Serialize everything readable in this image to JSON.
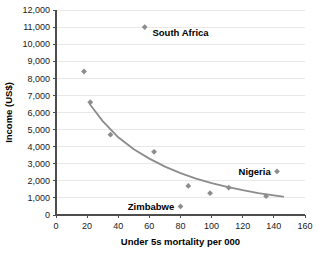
{
  "chart_data": {
    "type": "scatter",
    "title": "",
    "xlabel": "Under 5s mortality per 000",
    "ylabel": "Income (US$)",
    "xlim": [
      0,
      160
    ],
    "ylim": [
      0,
      12000
    ],
    "grid": "horizontal",
    "legend": "none",
    "xticks": [
      "0",
      "20",
      "40",
      "60",
      "80",
      "100",
      "120",
      "140",
      "160"
    ],
    "xtick_values": [
      0,
      20,
      40,
      60,
      80,
      100,
      120,
      140,
      160
    ],
    "yticks": [
      "0",
      "1,000",
      "2,000",
      "3,000",
      "4,000",
      "5,000",
      "6,000",
      "7,000",
      "8,000",
      "9,000",
      "10,000",
      "11,000",
      "12,000"
    ],
    "ytick_values": [
      0,
      1000,
      2000,
      3000,
      4000,
      5000,
      6000,
      7000,
      8000,
      9000,
      10000,
      11000,
      12000
    ],
    "marker_color": "#8c8c8c",
    "curve_color": "#8c8c8c",
    "series": [
      {
        "name": "Countries",
        "points": [
          {
            "x": 18,
            "y": 8400,
            "label": ""
          },
          {
            "x": 22,
            "y": 6600,
            "label": ""
          },
          {
            "x": 35,
            "y": 4700,
            "label": ""
          },
          {
            "x": 57,
            "y": 11000,
            "label": "South Africa"
          },
          {
            "x": 63,
            "y": 3700,
            "label": ""
          },
          {
            "x": 80,
            "y": 500,
            "label": "Zimbabwe"
          },
          {
            "x": 85,
            "y": 1700,
            "label": ""
          },
          {
            "x": 99,
            "y": 1280,
            "label": ""
          },
          {
            "x": 111,
            "y": 1600,
            "label": ""
          },
          {
            "x": 135,
            "y": 1100,
            "label": ""
          },
          {
            "x": 142,
            "y": 2550,
            "label": "Nigeria"
          }
        ]
      }
    ],
    "trend_curve": {
      "name": "fitted trend",
      "points": [
        {
          "x": 22,
          "y": 6450
        },
        {
          "x": 30,
          "y": 5500
        },
        {
          "x": 40,
          "y": 4550
        },
        {
          "x": 50,
          "y": 3850
        },
        {
          "x": 60,
          "y": 3300
        },
        {
          "x": 70,
          "y": 2830
        },
        {
          "x": 80,
          "y": 2450
        },
        {
          "x": 90,
          "y": 2130
        },
        {
          "x": 100,
          "y": 1870
        },
        {
          "x": 110,
          "y": 1650
        },
        {
          "x": 120,
          "y": 1450
        },
        {
          "x": 130,
          "y": 1280
        },
        {
          "x": 140,
          "y": 1150
        },
        {
          "x": 146,
          "y": 1080
        }
      ]
    },
    "annotations": [
      {
        "text": "South Africa",
        "x": 62,
        "y": 10700,
        "anchor": "start"
      },
      {
        "text": "Nigeria",
        "x": 138,
        "y": 2550,
        "anchor": "end"
      },
      {
        "text": "Zimbabwe",
        "x": 76,
        "y": 500,
        "anchor": "end"
      }
    ]
  }
}
